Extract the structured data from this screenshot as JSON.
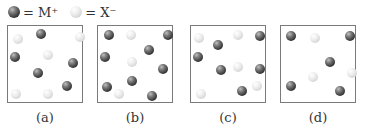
{
  "legend": {
    "items": [
      {
        "type": "m",
        "label": "= M⁺"
      },
      {
        "type": "x",
        "label": "= X⁻"
      }
    ]
  },
  "panels": [
    {
      "label": "(a)",
      "left": 7,
      "balls": [
        {
          "t": "m",
          "x": 33,
          "y": 8
        },
        {
          "t": "m",
          "x": 7,
          "y": 31
        },
        {
          "t": "m",
          "x": 30,
          "y": 47
        },
        {
          "t": "m",
          "x": 65,
          "y": 37
        },
        {
          "t": "m",
          "x": 59,
          "y": 60
        },
        {
          "t": "x",
          "x": 10,
          "y": 13
        },
        {
          "t": "x",
          "x": 72,
          "y": 11
        },
        {
          "t": "x",
          "x": 40,
          "y": 29
        },
        {
          "t": "x",
          "x": 8,
          "y": 68
        },
        {
          "t": "x",
          "x": 40,
          "y": 68
        }
      ]
    },
    {
      "label": "(b)",
      "left": 97,
      "balls": [
        {
          "t": "m",
          "x": 11,
          "y": 9
        },
        {
          "t": "m",
          "x": 70,
          "y": 9
        },
        {
          "t": "m",
          "x": 51,
          "y": 24
        },
        {
          "t": "m",
          "x": 7,
          "y": 31
        },
        {
          "t": "m",
          "x": 65,
          "y": 43
        },
        {
          "t": "m",
          "x": 9,
          "y": 61
        },
        {
          "t": "m",
          "x": 34,
          "y": 55
        },
        {
          "t": "m",
          "x": 54,
          "y": 70
        },
        {
          "t": "x",
          "x": 33,
          "y": 9
        },
        {
          "t": "x",
          "x": 34,
          "y": 36
        },
        {
          "t": "x",
          "x": 21,
          "y": 68
        }
      ]
    },
    {
      "label": "(c)",
      "left": 190,
      "balls": [
        {
          "t": "m",
          "x": 27,
          "y": 19
        },
        {
          "t": "m",
          "x": 7,
          "y": 31
        },
        {
          "t": "m",
          "x": 30,
          "y": 44
        },
        {
          "t": "m",
          "x": 69,
          "y": 43
        },
        {
          "t": "m",
          "x": 51,
          "y": 65
        },
        {
          "t": "m",
          "x": 69,
          "y": 10
        },
        {
          "t": "x",
          "x": 8,
          "y": 12
        },
        {
          "t": "x",
          "x": 47,
          "y": 9
        },
        {
          "t": "x",
          "x": 47,
          "y": 41
        },
        {
          "t": "x",
          "x": 66,
          "y": 60
        },
        {
          "t": "x",
          "x": 10,
          "y": 68
        }
      ]
    },
    {
      "label": "(d)",
      "left": 280,
      "balls": [
        {
          "t": "m",
          "x": 10,
          "y": 10
        },
        {
          "t": "m",
          "x": 69,
          "y": 10
        },
        {
          "t": "m",
          "x": 49,
          "y": 36
        },
        {
          "t": "m",
          "x": 10,
          "y": 60
        },
        {
          "t": "m",
          "x": 59,
          "y": 65
        },
        {
          "t": "x",
          "x": 34,
          "y": 12
        },
        {
          "t": "x",
          "x": 71,
          "y": 47
        },
        {
          "t": "x",
          "x": 32,
          "y": 51
        }
      ]
    }
  ]
}
